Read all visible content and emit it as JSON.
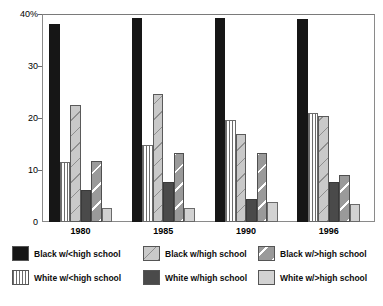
{
  "chart_data": {
    "type": "bar",
    "title": "",
    "subtitle": "",
    "xlabel": "",
    "ylabel": "",
    "ylim": [
      0,
      40
    ],
    "yticks": [
      0,
      10,
      20,
      30,
      40
    ],
    "ytick_labels": [
      "0",
      "10",
      "20",
      "30",
      "40%"
    ],
    "grid": false,
    "legend_position": "bottom",
    "categories": [
      "1980",
      "1985",
      "1990",
      "1996"
    ],
    "series": [
      {
        "name": "Black w/<high school",
        "pattern": "solid-black",
        "color": "#161616",
        "values": [
          38.0,
          39.3,
          39.2,
          39.0
        ]
      },
      {
        "name": "White w/<high school",
        "pattern": "vertical-stripes",
        "color": "#ffffff",
        "values": [
          11.5,
          14.8,
          19.7,
          21.0
        ]
      },
      {
        "name": "Black w/high school",
        "pattern": "diagonal-light",
        "color": "#c9c9c9",
        "values": [
          22.5,
          24.7,
          17.0,
          20.3
        ]
      },
      {
        "name": "White w/high school",
        "pattern": "solid-dark",
        "color": "#4a4a4a",
        "values": [
          6.2,
          7.6,
          4.5,
          7.6
        ]
      },
      {
        "name": "Black w/>high school",
        "pattern": "diagonal-mid",
        "color": "#9a9a9a",
        "values": [
          11.7,
          13.2,
          13.3,
          9.1
        ]
      },
      {
        "name": "White w/>high school",
        "pattern": "plain-light",
        "color": "#d2d2d2",
        "values": [
          2.7,
          2.6,
          3.9,
          3.4
        ]
      }
    ]
  },
  "axis": {
    "y_labels": [
      "40%",
      "30",
      "20",
      "10",
      "0"
    ],
    "x_labels": [
      "1980",
      "1985",
      "1990",
      "1996"
    ]
  },
  "legend": {
    "items": [
      {
        "label": "Black w/<high school",
        "pattern": "solid-black"
      },
      {
        "label": "Black w/high school",
        "pattern": "diagonal-light"
      },
      {
        "label": "Black w/>high school",
        "pattern": "diagonal-mid"
      },
      {
        "label": "White w/<high school",
        "pattern": "vertical-stripes"
      },
      {
        "label": "White w/high school",
        "pattern": "solid-dark"
      },
      {
        "label": "White w/>high school",
        "pattern": "plain-light"
      }
    ]
  }
}
